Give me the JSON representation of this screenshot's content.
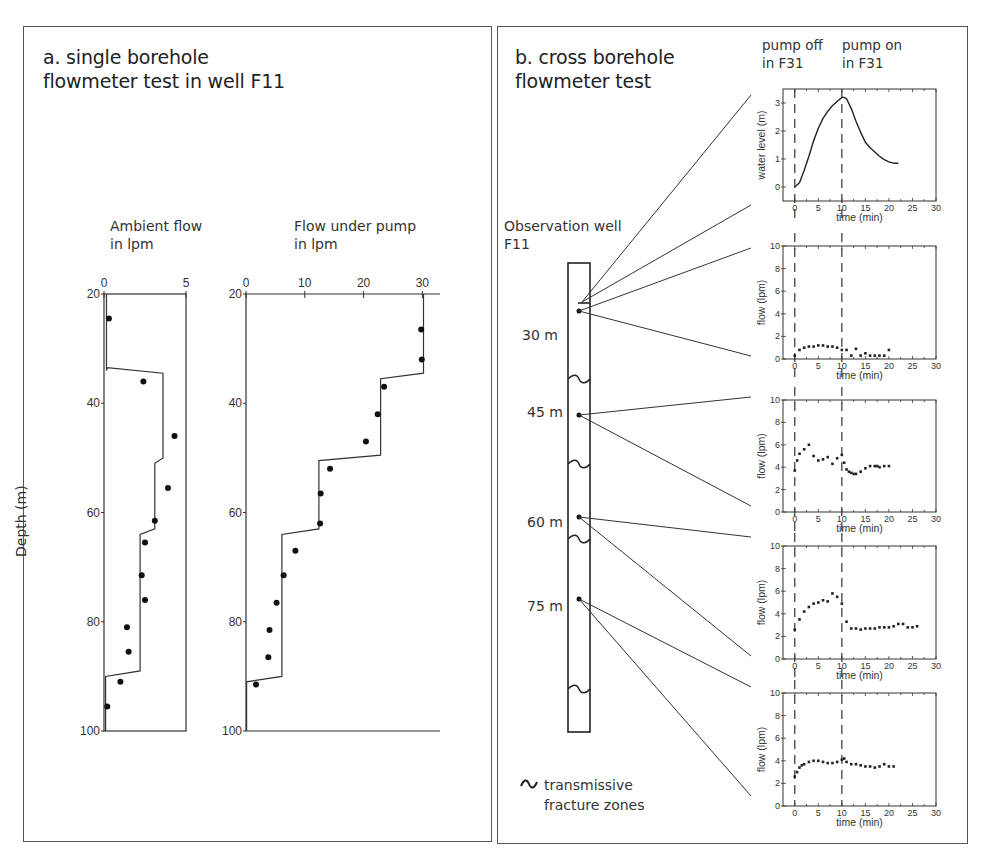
{
  "panel_a": {
    "title_line1": "a. single borehole",
    "title_line2": "flowmeter test in well F11",
    "ambient_label_line1": "Ambient flow",
    "ambient_label_line2": "in lpm",
    "pump_label_line1": "Flow under pump",
    "pump_label_line2": "in lpm",
    "depth_axis_label": "Depth (m)"
  },
  "panel_b": {
    "title_line1": "b. cross borehole",
    "title_line2": "flowmeter test",
    "pump_off_line1": "pump off",
    "pump_off_line2": "in F31",
    "pump_on_line1": "pump on",
    "pump_on_line2": "in F31",
    "well_label_line1": "Observation well",
    "well_label_line2": "F11",
    "depth_labels": [
      "30 m",
      "45 m",
      "60 m",
      "75 m"
    ],
    "legend_line1": "transmissive",
    "legend_line2": "fracture zones",
    "legend_icon": "wave-icon"
  },
  "chart_data": [
    {
      "id": "ambient_flow",
      "type": "scatter",
      "title": "Ambient flow in lpm",
      "xlabel": "Ambient flow (lpm)",
      "ylabel": "Depth (m)",
      "xlim": [
        0,
        5
      ],
      "ylim": [
        20,
        100
      ],
      "y_inverted": true,
      "x_ticks": [
        0,
        5
      ],
      "y_ticks": [
        20,
        40,
        60,
        80,
        100
      ],
      "points": [
        {
          "flow": 0.3,
          "depth": 24.5
        },
        {
          "flow": 2.4,
          "depth": 36
        },
        {
          "flow": 4.3,
          "depth": 46
        },
        {
          "flow": 3.9,
          "depth": 55.5
        },
        {
          "flow": 3.1,
          "depth": 61.5
        },
        {
          "flow": 2.5,
          "depth": 65.5
        },
        {
          "flow": 2.3,
          "depth": 71.5
        },
        {
          "flow": 2.5,
          "depth": 76
        },
        {
          "flow": 1.4,
          "depth": 81
        },
        {
          "flow": 1.5,
          "depth": 85.5
        },
        {
          "flow": 1.0,
          "depth": 91
        },
        {
          "flow": 0.2,
          "depth": 95.5
        }
      ],
      "model_line": [
        [
          0.15,
          20
        ],
        [
          0.15,
          34
        ],
        [
          0.2,
          33.5
        ],
        [
          3.6,
          34.5
        ],
        [
          3.6,
          50
        ],
        [
          3.1,
          51
        ],
        [
          3.1,
          63
        ],
        [
          2.2,
          64
        ],
        [
          2.2,
          89
        ],
        [
          0.1,
          90
        ],
        [
          0.1,
          100
        ]
      ]
    },
    {
      "id": "flow_under_pump",
      "type": "scatter",
      "title": "Flow under pump in lpm",
      "xlabel": "Flow under pump (lpm)",
      "ylabel": "Depth (m)",
      "xlim": [
        0,
        33
      ],
      "ylim": [
        20,
        100
      ],
      "y_inverted": true,
      "x_ticks": [
        0,
        10,
        20,
        30
      ],
      "y_ticks": [
        20,
        40,
        60,
        80,
        100
      ],
      "points": [
        {
          "flow": 29.8,
          "depth": 26.5
        },
        {
          "flow": 29.9,
          "depth": 32
        },
        {
          "flow": 23.5,
          "depth": 37
        },
        {
          "flow": 22.4,
          "depth": 42
        },
        {
          "flow": 20.4,
          "depth": 47
        },
        {
          "flow": 14.3,
          "depth": 52
        },
        {
          "flow": 12.7,
          "depth": 56.5
        },
        {
          "flow": 12.6,
          "depth": 62
        },
        {
          "flow": 8.4,
          "depth": 67
        },
        {
          "flow": 6.4,
          "depth": 71.5
        },
        {
          "flow": 5.2,
          "depth": 76.5
        },
        {
          "flow": 4.0,
          "depth": 81.5
        },
        {
          "flow": 3.8,
          "depth": 86.5
        },
        {
          "flow": 1.7,
          "depth": 91.5
        }
      ],
      "model_line": [
        [
          30.2,
          20
        ],
        [
          30.2,
          34.5
        ],
        [
          22.9,
          35.5
        ],
        [
          22.9,
          49.5
        ],
        [
          12.4,
          50.5
        ],
        [
          12.4,
          63
        ],
        [
          6.1,
          64
        ],
        [
          6.1,
          90
        ],
        [
          0.1,
          91
        ],
        [
          0.1,
          100
        ]
      ]
    },
    {
      "id": "water_level",
      "type": "line",
      "xlabel": "time (min)",
      "ylabel": "water level (m)",
      "xlim": [
        -2.5,
        30
      ],
      "ylim": [
        -0.5,
        3.5
      ],
      "x_ticks": [
        0,
        5,
        10,
        15,
        20,
        25,
        30
      ],
      "y_ticks": [
        0,
        1,
        2,
        3
      ],
      "vlines": [
        0,
        10
      ],
      "x": [
        0,
        1,
        2,
        3,
        4,
        5,
        6,
        7,
        8,
        9,
        10,
        10.5,
        11,
        12,
        13,
        14,
        15,
        16,
        17,
        18,
        19,
        20,
        21,
        22
      ],
      "y": [
        0.0,
        0.15,
        0.6,
        1.1,
        1.65,
        2.1,
        2.45,
        2.7,
        2.9,
        3.05,
        3.2,
        3.2,
        3.15,
        2.8,
        2.35,
        1.95,
        1.6,
        1.4,
        1.25,
        1.1,
        0.98,
        0.9,
        0.85,
        0.85
      ]
    },
    {
      "id": "flow_30m",
      "type": "scatter",
      "depth_label": "30 m",
      "xlabel": "time (min)",
      "ylabel": "flow (lpm)",
      "xlim": [
        -2.5,
        30
      ],
      "ylim": [
        0,
        10
      ],
      "x_ticks": [
        0,
        5,
        10,
        15,
        20,
        25,
        30
      ],
      "y_ticks": [
        0,
        2,
        4,
        6,
        8,
        10
      ],
      "vlines": [
        0,
        10
      ],
      "x": [
        0,
        1,
        2,
        3,
        4,
        5,
        6,
        7,
        8,
        9,
        10,
        11,
        12,
        13,
        14,
        15,
        16,
        17,
        18,
        19,
        20
      ],
      "y": [
        0.3,
        0.8,
        1.0,
        1.1,
        1.1,
        1.2,
        1.2,
        1.1,
        1.1,
        1.0,
        0.8,
        0.8,
        0.3,
        0.9,
        0.3,
        0.5,
        0.3,
        0.3,
        0.3,
        0.3,
        0.8
      ]
    },
    {
      "id": "flow_45m",
      "type": "scatter",
      "depth_label": "45 m",
      "xlabel": "time (min)",
      "ylabel": "flow (lpm)",
      "xlim": [
        -2.5,
        30
      ],
      "ylim": [
        0,
        10
      ],
      "x_ticks": [
        0,
        5,
        10,
        15,
        20,
        25,
        30
      ],
      "y_ticks": [
        0,
        2,
        4,
        6,
        8,
        10
      ],
      "vlines": [
        0,
        10
      ],
      "x": [
        0,
        0.5,
        1,
        2,
        3,
        4,
        5,
        6,
        7,
        8,
        9,
        10,
        10.5,
        11,
        11.5,
        12,
        12.5,
        13,
        14,
        15,
        16,
        17,
        17.5,
        18,
        19,
        20
      ],
      "y": [
        3.7,
        4.6,
        5.2,
        5.6,
        6.0,
        5.0,
        4.6,
        4.7,
        4.9,
        4.3,
        4.8,
        5.1,
        4.4,
        3.8,
        3.6,
        3.5,
        3.4,
        3.4,
        3.6,
        3.9,
        4.1,
        4.1,
        4.1,
        4.0,
        4.1,
        4.1
      ]
    },
    {
      "id": "flow_60m",
      "type": "scatter",
      "depth_label": "60 m",
      "xlabel": "time (min)",
      "ylabel": "flow (lpm)",
      "xlim": [
        -2.5,
        30
      ],
      "ylim": [
        0,
        10
      ],
      "x_ticks": [
        0,
        5,
        10,
        15,
        20,
        25,
        30
      ],
      "y_ticks": [
        0,
        2,
        4,
        6,
        8,
        10
      ],
      "vlines": [
        0,
        10
      ],
      "x": [
        0,
        1,
        2,
        3,
        4,
        5,
        6,
        7,
        8,
        9,
        10,
        11,
        12,
        13,
        14,
        15,
        16,
        17,
        18,
        19,
        20,
        21,
        22,
        23,
        24,
        25,
        26
      ],
      "y": [
        2.6,
        3.5,
        4.2,
        4.6,
        4.9,
        5.0,
        5.2,
        5.1,
        5.8,
        5.5,
        4.9,
        3.3,
        2.7,
        2.7,
        2.6,
        2.7,
        2.7,
        2.7,
        2.8,
        2.8,
        2.8,
        2.9,
        3.1,
        3.1,
        2.8,
        2.8,
        2.9
      ]
    },
    {
      "id": "flow_75m",
      "type": "scatter",
      "depth_label": "75 m",
      "xlabel": "time (min)",
      "ylabel": "flow (lpm)",
      "xlim": [
        -2.5,
        30
      ],
      "ylim": [
        0,
        10
      ],
      "x_ticks": [
        0,
        5,
        10,
        15,
        20,
        25,
        30
      ],
      "y_ticks": [
        0,
        2,
        4,
        6,
        8,
        10
      ],
      "vlines": [
        0,
        10
      ],
      "x": [
        0,
        0.5,
        1,
        1.5,
        2,
        3,
        4,
        5,
        6,
        7,
        8,
        9,
        10,
        10.5,
        11,
        12,
        13,
        14,
        15,
        16,
        17,
        18,
        19,
        20,
        21
      ],
      "y": [
        2.6,
        3.0,
        3.4,
        3.6,
        3.7,
        3.9,
        4.0,
        4.0,
        3.9,
        3.8,
        3.8,
        3.9,
        4.1,
        4.2,
        3.9,
        3.7,
        3.7,
        3.6,
        3.5,
        3.5,
        3.4,
        3.5,
        3.7,
        3.5,
        3.5
      ]
    }
  ]
}
